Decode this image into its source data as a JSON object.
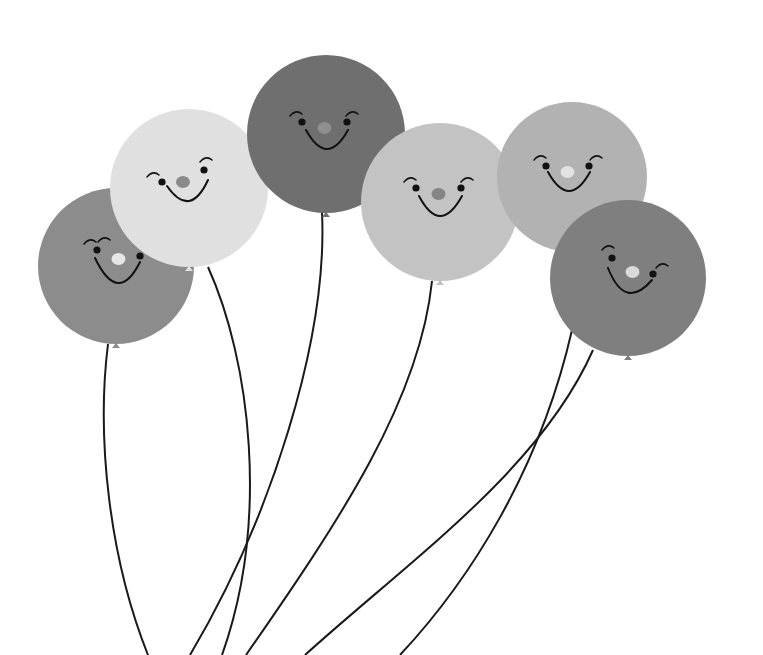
{
  "scene": {
    "width": 763,
    "height": 655,
    "background": "#ffffff",
    "description": "Six smiling balloons with strings",
    "string_color": "#1a1a1a",
    "face_color": "#111111"
  },
  "balloons": [
    {
      "id": "balloon-left",
      "cx": 116,
      "cy": 266,
      "r": 78,
      "fill": "#8c8c8c",
      "nose": "#e6e6e6",
      "eyes": [
        [
          97,
          250
        ],
        [
          140,
          256
        ]
      ],
      "brow": [
        [
          90,
          240
        ],
        [
          104,
          238
        ]
      ],
      "mouth": [
        95,
        258,
        140,
        262,
        118,
        292
      ],
      "string": "M108,344 C96,440 110,560 148,655"
    },
    {
      "id": "balloon-light-left",
      "cx": 189,
      "cy": 188,
      "r": 79,
      "fill": "#e0e0e0",
      "nose": "#8a8a8a",
      "eyes": [
        [
          162,
          182
        ],
        [
          204,
          170
        ]
      ],
      "brow": [
        [
          153,
          173
        ],
        [
          206,
          158
        ]
      ],
      "mouth": [
        167,
        186,
        208,
        180,
        190,
        205
      ],
      "string": "M208,267 C250,360 270,520 222,655"
    },
    {
      "id": "balloon-top-dark",
      "cx": 326,
      "cy": 134,
      "r": 79,
      "fill": "#6f6f6f",
      "nose": "#8e8e8e",
      "eyes": [
        [
          302,
          122
        ],
        [
          347,
          122
        ]
      ],
      "brow": [
        [
          296,
          112
        ],
        [
          352,
          112
        ]
      ],
      "mouth": [
        306,
        130,
        348,
        130,
        327,
        154
      ],
      "string": "M322,212 C328,340 270,520 190,655"
    },
    {
      "id": "balloon-center-light",
      "cx": 440,
      "cy": 202,
      "r": 79,
      "fill": "#c3c3c3",
      "nose": "#858585",
      "eyes": [
        [
          416,
          188
        ],
        [
          461,
          188
        ]
      ],
      "brow": [
        [
          410,
          178
        ],
        [
          467,
          178
        ]
      ],
      "mouth": [
        419,
        196,
        462,
        196,
        440,
        222
      ],
      "string": "M432,281 C420,400 340,520 246,655"
    },
    {
      "id": "balloon-right-back",
      "cx": 572,
      "cy": 177,
      "r": 75,
      "fill": "#b2b2b2",
      "nose": "#e2e2e2",
      "eyes": [
        [
          546,
          166
        ],
        [
          589,
          166
        ]
      ],
      "brow": [
        [
          540,
          156
        ],
        [
          596,
          156
        ]
      ],
      "mouth": [
        548,
        172,
        590,
        172,
        569,
        196
      ],
      "string": "M572,330 C540,470 470,580 400,655"
    },
    {
      "id": "balloon-right-front",
      "cx": 628,
      "cy": 278,
      "r": 78,
      "fill": "#7f7f7f",
      "nose": "#d9d9d9",
      "eyes": [
        [
          612,
          258
        ],
        [
          653,
          274
        ]
      ],
      "brow": [
        [
          608,
          246
        ],
        [
          662,
          264
        ]
      ],
      "mouth": [
        608,
        268,
        652,
        280,
        625,
        297
      ],
      "string": "M593,350 C540,470 410,560 305,655"
    }
  ]
}
